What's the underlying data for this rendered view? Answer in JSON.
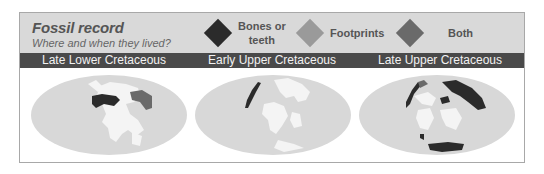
{
  "header": {
    "title": "Fossil record",
    "subtitle": "Where and when they lived?"
  },
  "legend": [
    {
      "label_line1": "Bones or",
      "label_line2": "teeth",
      "color": "#2b2b2b",
      "icon": "diamond-icon"
    },
    {
      "label_line1": "Footprints",
      "label_line2": "",
      "color": "#9a9a9a",
      "icon": "diamond-icon"
    },
    {
      "label_line1": "Both",
      "label_line2": "",
      "color": "#6a6a6a",
      "icon": "diamond-icon"
    }
  ],
  "periods": [
    {
      "label": "Late Lower Cretaceous"
    },
    {
      "label": "Early Upper Cretaceous"
    },
    {
      "label": "Late Upper Cretaceous"
    }
  ],
  "colors": {
    "ocean": "#d8d8d8",
    "land": "#f4f4f4",
    "bones": "#2b2b2b",
    "footprints": "#9a9a9a",
    "both": "#6a6a6a",
    "header_bg": "#d9d9d9",
    "bar_bg": "#4a4a4a"
  }
}
